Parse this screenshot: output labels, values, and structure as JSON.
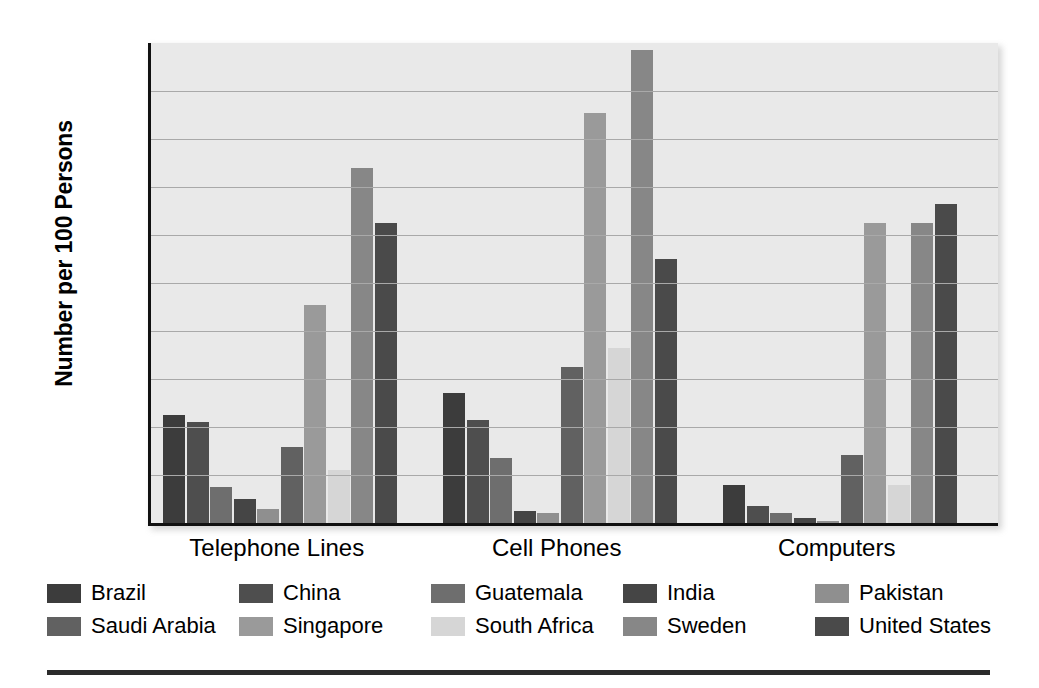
{
  "chart_data": {
    "type": "bar",
    "title": "",
    "subtitle": "",
    "xlabel": "",
    "ylabel": "Number per 100 Persons",
    "ylim": [
      0,
      100
    ],
    "ytick_step": 10,
    "yticks": [
      "100",
      "90",
      "80",
      "70",
      "60",
      "50",
      "40",
      "30",
      "20",
      "10",
      "0"
    ],
    "grid": true,
    "legend_position": "bottom",
    "categories": [
      "Telephone Lines",
      "Cell Phones",
      "Computers"
    ],
    "series": [
      {
        "name": "Brazil",
        "color": "#3c3c3c",
        "values": [
          22.5,
          27.0,
          8.0
        ]
      },
      {
        "name": "China",
        "color": "#4e4e4e",
        "values": [
          21.0,
          21.5,
          3.5
        ]
      },
      {
        "name": "Guatemala",
        "color": "#6e6e6e",
        "values": [
          7.5,
          13.5,
          2.0
        ]
      },
      {
        "name": "India",
        "color": "#454545",
        "values": [
          5.0,
          2.5,
          1.0
        ]
      },
      {
        "name": "Pakistan",
        "color": "#8f8f8f",
        "values": [
          3.0,
          2.0,
          0.5
        ]
      },
      {
        "name": "Saudi Arabia",
        "color": "#616161",
        "values": [
          15.8,
          32.5,
          14.2
        ]
      },
      {
        "name": "Singapore",
        "color": "#9a9a9a",
        "values": [
          45.5,
          85.5,
          62.5
        ]
      },
      {
        "name": "South Africa",
        "color": "#d6d6d6",
        "values": [
          11.0,
          36.5,
          8.0
        ]
      },
      {
        "name": "Sweden",
        "color": "#878787",
        "values": [
          74.0,
          98.5,
          62.5
        ]
      },
      {
        "name": "United States",
        "color": "#4a4a4a",
        "values": [
          62.5,
          55.0,
          66.5
        ]
      }
    ]
  },
  "axis": {
    "y_title": "Number per 100 Persons"
  },
  "legend": {
    "rows": [
      [
        "Brazil",
        "China",
        "Guatemala",
        "India",
        "Pakistan"
      ],
      [
        "Saudi Arabia",
        "Singapore",
        "South Africa",
        "Sweden",
        "United States"
      ]
    ]
  }
}
